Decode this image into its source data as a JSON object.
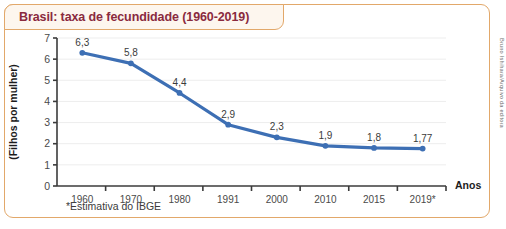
{
  "title": "Brasil: taxa de fecundidade (1960-2019)",
  "footnote": "*Estimativa do IBGE",
  "credit": "Bruno Ishihara/Arquivo da editora",
  "colors": {
    "line": "#3d6fb4",
    "frame": "#e2a86a",
    "title_text": "#8a2a3e",
    "title_bg": "#fdf6ee",
    "grid": "#ededed",
    "axis": "#3b3b3b"
  },
  "chart_data": {
    "type": "line",
    "title": "Brasil: taxa de fecundidade (1960-2019)",
    "xlabel": "Anos",
    "ylabel": "(Filhos por mulher)",
    "categories": [
      "1960",
      "1970",
      "1980",
      "1991",
      "2000",
      "2010",
      "2015",
      "2019*"
    ],
    "values": [
      6.3,
      5.8,
      4.4,
      2.9,
      2.3,
      1.9,
      1.8,
      1.77
    ],
    "point_labels": [
      "6,3",
      "5,8",
      "4,4",
      "2,9",
      "2,3",
      "1,9",
      "1,8",
      "1,77"
    ],
    "ylim": [
      0,
      7
    ],
    "yticks": [
      0,
      1,
      2,
      3,
      4,
      5,
      6,
      7
    ],
    "ytick_labels": [
      "0",
      "1",
      "2",
      "3",
      "4",
      "5",
      "6",
      "7"
    ],
    "grid": true,
    "legend": false,
    "note": "*Estimativa do IBGE"
  }
}
